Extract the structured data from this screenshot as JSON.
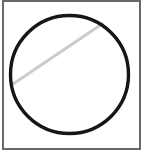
{
  "canvas": {
    "width": 146,
    "height": 161,
    "background": "#ffffff"
  },
  "drawing": {
    "description": "circle-with-diagonal-chord",
    "frame": {
      "x": 3,
      "y": 1,
      "width": 137,
      "height": 148,
      "stroke": "#686868",
      "stroke_width": 2,
      "fill": "#ffffff"
    },
    "circle": {
      "cx": 69.5,
      "cy": 74.5,
      "r": 59,
      "stroke": "#161616",
      "stroke_width": 3.4,
      "fill": "none"
    },
    "diagonal_line": {
      "x1": 13,
      "y1": 84,
      "x2": 102,
      "y2": 24,
      "stroke": "#cccccc",
      "stroke_width": 3.2,
      "linecap": "round"
    }
  }
}
